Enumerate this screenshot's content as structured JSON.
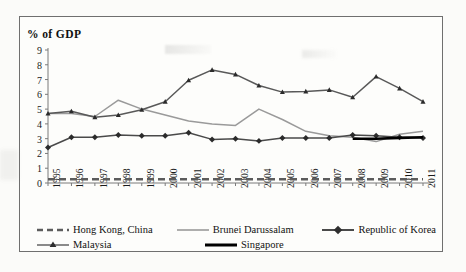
{
  "chart_data": {
    "type": "line",
    "title": "",
    "ylabel": "%  of GDP",
    "xlabel": "",
    "ylim": [
      0,
      9
    ],
    "yticks": [
      0,
      1,
      2,
      3,
      4,
      5,
      6,
      7,
      8,
      9
    ],
    "grid": false,
    "legend_position": "bottom",
    "categories": [
      "1995",
      "1996",
      "1997",
      "1998",
      "1999",
      "2000",
      "2001",
      "2002",
      "2003",
      "2004",
      "2005",
      "2006",
      "2007",
      "2008",
      "2009",
      "2010",
      "2011"
    ],
    "series": [
      {
        "name": "Hong Kong, China",
        "style": "dashed",
        "color": "#5c5c5c",
        "marker": "none",
        "values": [
          0.25,
          0.25,
          0.25,
          0.25,
          0.25,
          0.25,
          0.25,
          0.25,
          0.25,
          0.25,
          0.25,
          0.25,
          0.25,
          0.25,
          0.25,
          0.25,
          0.25
        ]
      },
      {
        "name": "Brunei Darussalam",
        "style": "solid-light",
        "color": "#9a9a9a",
        "marker": "none",
        "values": [
          4.7,
          4.7,
          4.5,
          5.6,
          5.0,
          4.6,
          4.2,
          4.0,
          3.9,
          5.0,
          4.3,
          3.5,
          3.2,
          3.1,
          2.8,
          3.3,
          3.5
        ]
      },
      {
        "name": "Republic of Korea",
        "style": "solid-marker",
        "color": "#4a4a4a",
        "marker": "diamond",
        "values": [
          2.4,
          3.1,
          3.1,
          3.25,
          3.2,
          3.2,
          3.4,
          2.95,
          3.0,
          2.85,
          3.05,
          3.05,
          3.05,
          3.25,
          3.2,
          3.1,
          3.05
        ]
      },
      {
        "name": "Malaysia",
        "style": "solid-marker",
        "color": "#595959",
        "marker": "triangle",
        "values": [
          4.7,
          4.85,
          4.45,
          4.6,
          4.95,
          5.5,
          6.95,
          7.65,
          7.35,
          6.6,
          6.15,
          6.2,
          6.3,
          5.8,
          7.2,
          6.4,
          5.5
        ]
      },
      {
        "name": "Singapore",
        "style": "solid-thick",
        "color": "#000000",
        "marker": "none",
        "values": [
          null,
          null,
          null,
          null,
          null,
          null,
          null,
          null,
          null,
          null,
          null,
          null,
          null,
          3.0,
          3.0,
          3.05,
          3.1
        ]
      }
    ]
  },
  "legend": {
    "items": [
      {
        "label": "Hong Kong, China",
        "key": "dashed-key"
      },
      {
        "label": "Brunei Darussalam",
        "key": "light-line-key"
      },
      {
        "label": "Republic of Korea",
        "key": "diamond-line-key"
      },
      {
        "label": "Malaysia",
        "key": "triangle-line-key"
      },
      {
        "label": "Singapore",
        "key": "thick-line-key"
      }
    ]
  }
}
